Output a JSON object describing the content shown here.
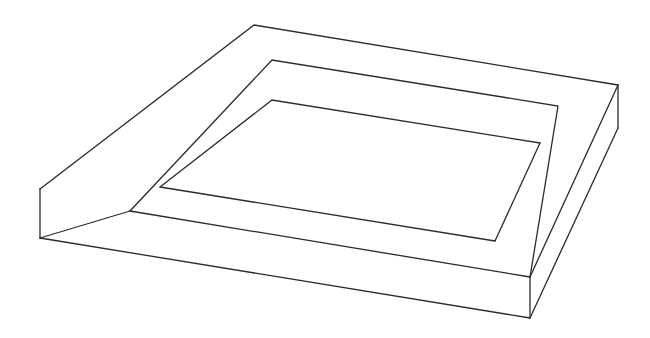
{
  "diagram": {
    "title": "",
    "stroke_color": "#2a2a2a",
    "background": "#ffffff",
    "polylines": {
      "outer_top_rim": "40,189 254,25 618,85",
      "outer_left_vertical": "40,189 40,238",
      "outer_bottom_front": "40,238 530,318",
      "outer_front_vertical": "530,277 530,318",
      "outer_right_vertical": "618,85 618,128",
      "outer_right_bottom": "618,128 530,318",
      "outer_right_top": "618,85 530,277",
      "middle_rim": "130,211 272,60 558,106 530,277",
      "middle_front": "130,211 530,277",
      "middle_left_to_outer": "40,238 130,211",
      "inner_back": "160,187 272,100 540,143",
      "inner_right": "540,143 495,241",
      "inner_front": "160,187 495,241"
    }
  }
}
